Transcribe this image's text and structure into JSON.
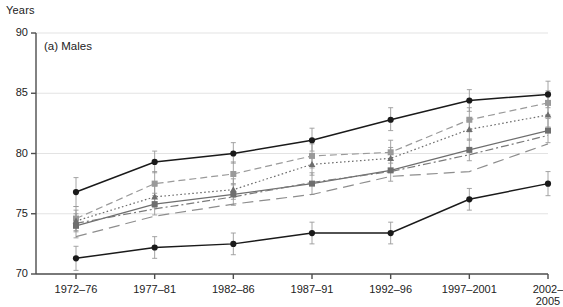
{
  "axis_unit": "Years",
  "panel_label": "(a) Males",
  "colors": {
    "series_dark": "#1a1a1a",
    "series_gray": "#6e6e6e",
    "series_light_gray": "#9a9a9a",
    "gridline": "#e3e3e3",
    "axis": "#4d4d4d",
    "errorbar": "#9a9a9a"
  },
  "chart_data": {
    "type": "line",
    "title": "(a) Males",
    "xlabel": "",
    "ylabel": "Years",
    "ylim": [
      70,
      90
    ],
    "yticks": [
      70,
      75,
      80,
      85,
      90
    ],
    "grid": true,
    "legend": "none",
    "error_bars": true,
    "categories": [
      "1972–76",
      "1977–81",
      "1982–86",
      "1987–91",
      "1992–96",
      "1997–2001",
      "2002–2005"
    ],
    "series": [
      {
        "name": "Series 1",
        "style": "solid",
        "color": "#1a1a1a",
        "marker": "circle",
        "values": [
          76.8,
          79.3,
          80.0,
          81.1,
          82.8,
          84.4,
          84.9
        ],
        "error_low": [
          75.6,
          78.4,
          79.2,
          80.2,
          81.9,
          83.5,
          83.8
        ],
        "error_high": [
          78.0,
          80.2,
          80.9,
          82.1,
          83.8,
          85.3,
          86.0
        ]
      },
      {
        "name": "Series 2",
        "style": "dashed",
        "color": "#9a9a9a",
        "marker": "square",
        "values": [
          74.6,
          77.5,
          78.3,
          79.8,
          80.1,
          82.8,
          84.2
        ],
        "error_low": [
          73.6,
          76.5,
          77.4,
          78.8,
          79.2,
          81.8,
          83.2
        ],
        "error_high": [
          75.6,
          78.5,
          79.3,
          80.8,
          81.1,
          83.8,
          85.2
        ]
      },
      {
        "name": "Series 3",
        "style": "dotted",
        "color": "#6e6e6e",
        "marker": "triangle",
        "values": [
          74.4,
          76.4,
          77.0,
          79.1,
          79.6,
          82.0,
          83.2
        ],
        "error_low": [
          73.5,
          75.5,
          76.2,
          78.2,
          78.7,
          81.1,
          82.2
        ],
        "error_high": [
          75.3,
          77.3,
          77.9,
          80.0,
          80.5,
          82.9,
          84.2
        ]
      },
      {
        "name": "Series 4",
        "style": "solid-gray",
        "color": "#6e6e6e",
        "marker": "square-gray",
        "values": [
          74.0,
          75.8,
          76.6,
          77.5,
          78.6,
          80.3,
          81.9
        ],
        "error_low": [
          73.0,
          74.9,
          75.7,
          76.6,
          77.7,
          79.4,
          80.9
        ],
        "error_high": [
          75.0,
          76.7,
          77.5,
          78.4,
          79.5,
          81.2,
          82.9
        ]
      },
      {
        "name": "Series 5",
        "style": "dash-dot",
        "color": "#7a7a7a",
        "marker": "none",
        "values": [
          74.2,
          75.4,
          76.4,
          77.6,
          78.5,
          79.9,
          81.5
        ],
        "error_low": [
          74.2,
          75.4,
          76.4,
          77.6,
          78.5,
          79.9,
          81.5
        ],
        "error_high": [
          74.2,
          75.4,
          76.4,
          77.6,
          78.5,
          79.9,
          81.5
        ]
      },
      {
        "name": "Series 6",
        "style": "long-dashed",
        "color": "#8d8d8d",
        "marker": "none",
        "values": [
          73.1,
          74.8,
          75.8,
          76.6,
          78.1,
          78.5,
          80.8
        ],
        "error_low": [
          73.1,
          74.8,
          75.8,
          76.6,
          78.1,
          78.5,
          80.8
        ],
        "error_high": [
          73.1,
          74.8,
          75.8,
          76.6,
          78.1,
          78.5,
          80.8
        ]
      },
      {
        "name": "Series 7",
        "style": "solid",
        "color": "#1a1a1a",
        "marker": "circle",
        "values": [
          71.3,
          72.2,
          72.5,
          73.4,
          73.4,
          76.2,
          77.5
        ],
        "error_low": [
          70.3,
          71.3,
          71.6,
          72.5,
          72.5,
          75.3,
          76.5
        ],
        "error_high": [
          72.3,
          73.1,
          73.4,
          74.3,
          74.3,
          77.1,
          78.5
        ]
      }
    ]
  }
}
